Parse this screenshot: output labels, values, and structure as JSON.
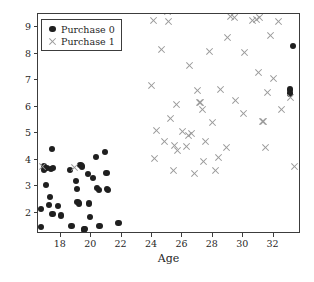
{
  "chart_data": {
    "type": "scatter",
    "title": "",
    "xlabel": "Age",
    "ylabel": "Experience",
    "xlim": [
      16.5,
      33.8
    ],
    "ylim": [
      1.2,
      9.5
    ],
    "xticks": [
      18,
      20,
      22,
      24,
      26,
      28,
      30,
      32
    ],
    "yticks": [
      2,
      3,
      4,
      5,
      6,
      7,
      8,
      9
    ],
    "grid": false,
    "legend_position": "upper left",
    "series": [
      {
        "name": "Purchase 0",
        "marker": "circle",
        "color": "#1f1f1f",
        "points": [
          [
            16.7,
            1.45
          ],
          [
            16.7,
            2.15
          ],
          [
            16.9,
            3.75
          ],
          [
            16.9,
            3.6
          ],
          [
            17.0,
            3.05
          ],
          [
            17.1,
            3.7
          ],
          [
            17.2,
            2.3
          ],
          [
            17.3,
            2.6
          ],
          [
            17.35,
            3.65
          ],
          [
            17.4,
            4.4
          ],
          [
            17.45,
            1.95
          ],
          [
            17.5,
            3.7
          ],
          [
            17.8,
            2.25
          ],
          [
            18.0,
            1.9
          ],
          [
            18.6,
            3.6
          ],
          [
            18.7,
            1.5
          ],
          [
            19.0,
            3.2
          ],
          [
            19.05,
            2.9
          ],
          [
            19.1,
            2.4
          ],
          [
            19.2,
            2.35
          ],
          [
            19.3,
            3.8
          ],
          [
            19.4,
            3.75
          ],
          [
            19.5,
            1.35
          ],
          [
            19.55,
            1.4
          ],
          [
            19.6,
            1.4
          ],
          [
            19.8,
            3.45
          ],
          [
            19.85,
            2.35
          ],
          [
            19.9,
            1.85
          ],
          [
            20.1,
            3.3
          ],
          [
            20.3,
            4.1
          ],
          [
            20.4,
            2.95
          ],
          [
            20.5,
            2.85
          ],
          [
            20.55,
            1.5
          ],
          [
            20.9,
            4.3
          ],
          [
            21.0,
            3.5
          ],
          [
            21.05,
            2.9
          ],
          [
            21.1,
            2.85
          ],
          [
            21.8,
            1.6
          ],
          [
            33.3,
            8.3
          ],
          [
            33.05,
            6.65
          ],
          [
            33.05,
            6.5
          ]
        ]
      },
      {
        "name": "Purchase 1",
        "marker": "x",
        "color": "#9a9a9a",
        "points": [
          [
            16.8,
            3.75
          ],
          [
            18.9,
            3.7
          ],
          [
            24.0,
            6.8
          ],
          [
            24.1,
            9.25
          ],
          [
            24.15,
            4.05
          ],
          [
            24.3,
            5.1
          ],
          [
            24.6,
            8.15
          ],
          [
            24.85,
            4.7
          ],
          [
            25.0,
            9.6
          ],
          [
            25.1,
            9.2
          ],
          [
            25.2,
            5.55
          ],
          [
            25.4,
            3.6
          ],
          [
            25.5,
            4.55
          ],
          [
            25.6,
            6.1
          ],
          [
            25.7,
            4.35
          ],
          [
            26.0,
            5.05
          ],
          [
            26.25,
            4.5
          ],
          [
            26.4,
            4.9
          ],
          [
            26.5,
            7.55
          ],
          [
            26.6,
            5.0
          ],
          [
            26.8,
            3.5
          ],
          [
            27.0,
            6.6
          ],
          [
            27.1,
            6.15
          ],
          [
            27.2,
            6.15
          ],
          [
            27.35,
            5.9
          ],
          [
            27.4,
            3.95
          ],
          [
            27.5,
            4.7
          ],
          [
            27.8,
            8.1
          ],
          [
            28.0,
            5.4
          ],
          [
            28.2,
            3.6
          ],
          [
            28.4,
            4.1
          ],
          [
            28.5,
            6.65
          ],
          [
            28.9,
            4.45
          ],
          [
            29.0,
            8.6
          ],
          [
            29.2,
            9.4
          ],
          [
            29.4,
            9.35
          ],
          [
            29.5,
            6.25
          ],
          [
            30.0,
            5.75
          ],
          [
            30.1,
            8.05
          ],
          [
            30.6,
            9.25
          ],
          [
            30.9,
            9.3
          ],
          [
            31.0,
            7.3
          ],
          [
            31.1,
            9.35
          ],
          [
            31.3,
            5.45
          ],
          [
            31.35,
            5.45
          ],
          [
            31.5,
            4.45
          ],
          [
            31.6,
            6.55
          ],
          [
            31.8,
            8.7
          ],
          [
            32.0,
            7.05
          ],
          [
            32.3,
            9.2
          ],
          [
            32.5,
            5.9
          ],
          [
            33.4,
            3.75
          ],
          [
            33.1,
            6.35
          ]
        ]
      }
    ]
  },
  "legend": {
    "entries": [
      {
        "label": "Purchase 0",
        "marker": "circle-marker-icon"
      },
      {
        "label": "Purchase 1",
        "marker": "cross-marker-icon"
      }
    ]
  }
}
